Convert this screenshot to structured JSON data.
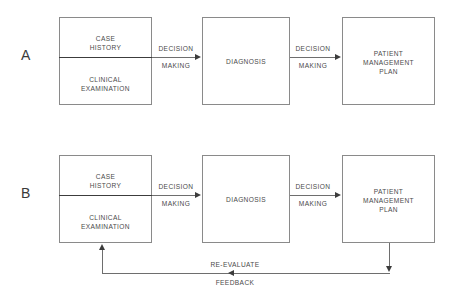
{
  "figure": {
    "background_color": "#ffffff",
    "line_color": "#6e6e6e",
    "text_color": "#4a4a4a",
    "arrow_color": "#3c3c3c"
  },
  "panels": [
    {
      "id": "A",
      "label": "A",
      "nodes": {
        "case_history": "CASE\nHISTORY",
        "clinical_examination": "CLINICAL\nEXAMINATION",
        "diagnosis": "DIAGNOSIS",
        "patient_management_plan": "PATIENT\nMANAGEMENT\nPLAN"
      },
      "edges": {
        "edge1_above": "DECISION",
        "edge1_below": "MAKING",
        "edge2_above": "DECISION",
        "edge2_below": "MAKING"
      }
    },
    {
      "id": "B",
      "label": "B",
      "nodes": {
        "case_history": "CASE\nHISTORY",
        "clinical_examination": "CLINICAL\nEXAMINATION",
        "diagnosis": "DIAGNOSIS",
        "patient_management_plan": "PATIENT\nMANAGEMENT\nPLAN"
      },
      "edges": {
        "edge1_above": "DECISION",
        "edge1_below": "MAKING",
        "edge2_above": "DECISION",
        "edge2_below": "MAKING",
        "feedback_above": "RE-EVALUATE",
        "feedback_below": "FEEDBACK"
      }
    }
  ]
}
